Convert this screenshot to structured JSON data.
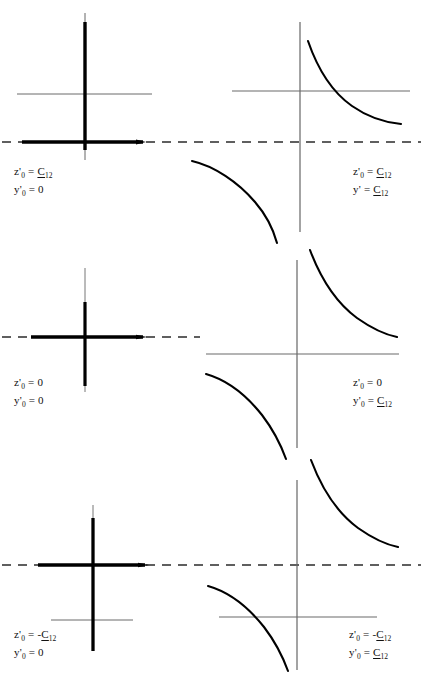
{
  "figure": {
    "type": "diagram",
    "background_color": "#ffffff",
    "ink_color": "#000000",
    "axis_color": "#555555",
    "dash_color": "#333333",
    "rows": 3,
    "columns": 2
  },
  "panels": [
    {
      "id": "panel-top-left",
      "row": 1,
      "column": 1,
      "kind": "degenerate-cross",
      "labels": {
        "line1": {
          "var": "z",
          "sub": "0",
          "prime": true,
          "eq": "=",
          "value": "C",
          "value_sub": "12",
          "negative": false,
          "underlined": true
        },
        "line2": {
          "var": "y",
          "sub": "0",
          "prime": true,
          "eq": "=",
          "value": "0",
          "value_sub": "",
          "negative": false,
          "underlined": false
        }
      },
      "label_text_1": "z'0 = C12",
      "label_text_2": "y'0 = 0",
      "axis_origin_offset": "axis above dashed line"
    },
    {
      "id": "panel-top-right",
      "row": 1,
      "column": 2,
      "kind": "hyperbola-pair",
      "labels": {
        "line1": {
          "var": "z",
          "sub": "0",
          "prime": true,
          "eq": "=",
          "value": "C",
          "value_sub": "12",
          "negative": false,
          "underlined": true
        },
        "line2": {
          "var": "y",
          "sub": "",
          "prime": true,
          "eq": "=",
          "value": "C",
          "value_sub": "12",
          "negative": false,
          "underlined": true
        }
      },
      "label_text_1": "z'0 = C12",
      "label_text_2": "y' = C12",
      "axis_origin_offset": "axis above dashed line"
    },
    {
      "id": "panel-middle-left",
      "row": 2,
      "column": 1,
      "kind": "degenerate-cross",
      "labels": {
        "line1": {
          "var": "z",
          "sub": "0",
          "prime": true,
          "eq": "=",
          "value": "0",
          "value_sub": "",
          "negative": false,
          "underlined": false
        },
        "line2": {
          "var": "y",
          "sub": "0",
          "prime": true,
          "eq": "=",
          "value": "0",
          "value_sub": "",
          "negative": false,
          "underlined": false
        }
      },
      "label_text_1": "z'0 = 0",
      "label_text_2": "y'0 = 0",
      "axis_origin_offset": "axis coincides with dashed line"
    },
    {
      "id": "panel-middle-right",
      "row": 2,
      "column": 2,
      "kind": "hyperbola-pair",
      "labels": {
        "line1": {
          "var": "z",
          "sub": "0",
          "prime": true,
          "eq": "=",
          "value": "0",
          "value_sub": "",
          "negative": false,
          "underlined": false
        },
        "line2": {
          "var": "y",
          "sub": "0",
          "prime": true,
          "eq": "=",
          "value": "C",
          "value_sub": "12",
          "negative": false,
          "underlined": true
        }
      },
      "label_text_1": "z'0 = 0",
      "label_text_2": "y'0 = C12",
      "axis_origin_offset": "axis coincides with dashed line"
    },
    {
      "id": "panel-bottom-left",
      "row": 3,
      "column": 1,
      "kind": "degenerate-cross",
      "labels": {
        "line1": {
          "var": "z",
          "sub": "0",
          "prime": true,
          "eq": "=",
          "value": "C",
          "value_sub": "12",
          "negative": true,
          "underlined": true
        },
        "line2": {
          "var": "y",
          "sub": "0",
          "prime": true,
          "eq": "=",
          "value": "0",
          "value_sub": "",
          "negative": false,
          "underlined": false
        }
      },
      "label_text_1": "z'0 = -C12",
      "label_text_2": "y'0 = 0",
      "axis_origin_offset": "axis below dashed line"
    },
    {
      "id": "panel-bottom-right",
      "row": 3,
      "column": 2,
      "kind": "hyperbola-pair",
      "labels": {
        "line1": {
          "var": "z",
          "sub": "0",
          "prime": true,
          "eq": "=",
          "value": "C",
          "value_sub": "12",
          "negative": true,
          "underlined": true
        },
        "line2": {
          "var": "y",
          "sub": "0",
          "prime": true,
          "eq": "=",
          "value": "C",
          "value_sub": "12",
          "negative": false,
          "underlined": true
        }
      },
      "label_text_1": "z'0 = -C12",
      "label_text_2": "y'0 = C12",
      "axis_origin_offset": "axis below dashed line"
    }
  ],
  "symbols": {
    "z": "z",
    "y": "y",
    "C": "C",
    "zero": "0",
    "equals": "=",
    "minus": "-",
    "prime": "'",
    "sub_zero": "0",
    "sub_twelve": "12"
  }
}
